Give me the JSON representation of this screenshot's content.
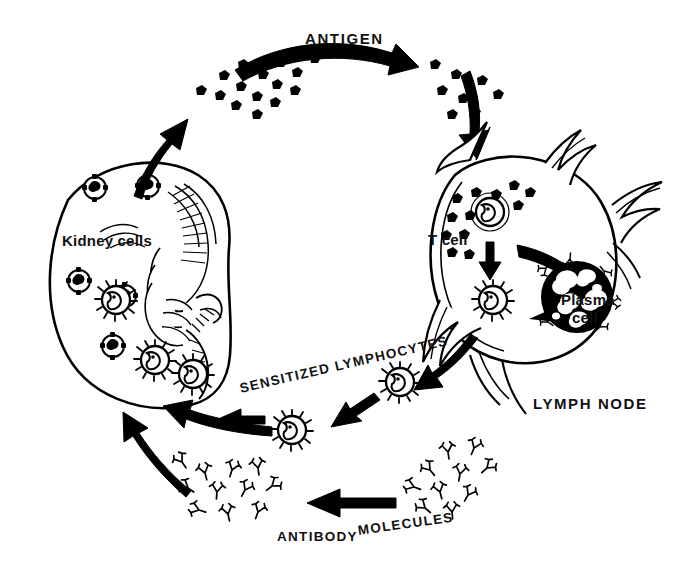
{
  "diagram": {
    "ink_color": "#000000",
    "background_color": "#ffffff"
  },
  "labels": {
    "antigen": "ANTIGEN",
    "kidney_cells": "Kidney cells",
    "t_cell": "T cell",
    "plasma_cell_line1": "Plasma",
    "plasma_cell_line2": "cell",
    "lymph_node": "LYMPH NODE",
    "sensitized_lymphocytes": "SENSITIZED LYMPHOCYTES",
    "antibody": "ANTIBODY",
    "molecules": "MOLECULES"
  },
  "structures": [
    {
      "name": "kidney",
      "role": "transplanted organ under attack"
    },
    {
      "name": "lymph-node",
      "role": "site of lymphocyte sensitization and antibody production"
    }
  ],
  "cell_types": [
    {
      "name": "kidney-cell",
      "appearance": "round cell with dark nucleus and surface antigen spikes"
    },
    {
      "name": "t-cell",
      "appearance": "round lymphocyte with kidney-bean nucleus"
    },
    {
      "name": "sensitized-lymphocyte",
      "appearance": "lymphocyte with spiky surface receptors"
    },
    {
      "name": "plasma-cell",
      "appearance": "large dark mottled cell secreting antibody"
    }
  ],
  "flow_steps": [
    {
      "step": 1,
      "from": "kidney",
      "to": "antigen-cloud",
      "label": "ANTIGEN"
    },
    {
      "step": 2,
      "from": "antigen-cloud",
      "to": "lymph-node",
      "label": ""
    },
    {
      "step": 3,
      "from": "t-cell",
      "to": "sensitized-t-cell",
      "label": ""
    },
    {
      "step": 4,
      "from": "sensitized-t-cell",
      "to": "plasma-cell",
      "label": ""
    },
    {
      "step": 5,
      "from": "lymph-node",
      "to": "sensitized-lymphocytes",
      "label": "SENSITIZED LYMPHOCYTES"
    },
    {
      "step": 6,
      "from": "sensitized-lymphocytes",
      "to": "kidney",
      "label": ""
    },
    {
      "step": 7,
      "from": "plasma-cell",
      "to": "antibody-molecules",
      "label": "ANTIBODY MOLECULES"
    },
    {
      "step": 8,
      "from": "antibody-molecules",
      "to": "kidney",
      "label": ""
    }
  ]
}
